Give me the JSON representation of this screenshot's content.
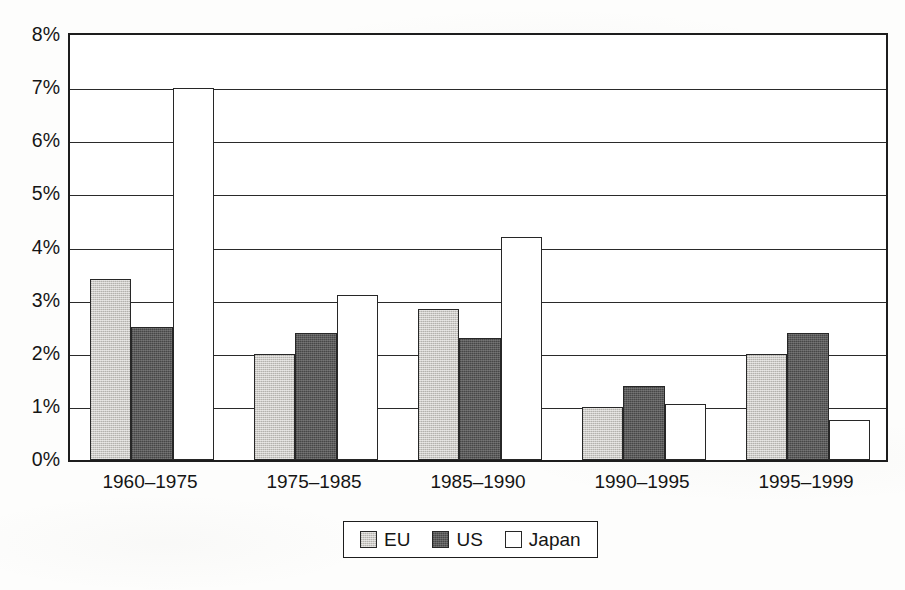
{
  "chart_data": {
    "type": "bar",
    "title": "",
    "subtitle": "",
    "xlabel": "",
    "ylabel": "",
    "ylim": [
      0,
      8
    ],
    "ytick_labels": [
      "0%",
      "1%",
      "2%",
      "3%",
      "4%",
      "5%",
      "6%",
      "7%",
      "8%"
    ],
    "ytick_values": [
      0,
      1,
      2,
      3,
      4,
      5,
      6,
      7,
      8
    ],
    "y_unit": "%",
    "grid": true,
    "grid_axis": "y",
    "legend_position": "bottom-center",
    "categories": [
      "1960–1975",
      "1975–1985",
      "1985–1990",
      "1990–1995",
      "1995–1999"
    ],
    "series": [
      {
        "name": "EU",
        "color": "#cccac6",
        "values": [
          3.4,
          2.0,
          2.85,
          1.0,
          2.0
        ]
      },
      {
        "name": "US",
        "color": "#5b5b5b",
        "values": [
          2.5,
          2.4,
          2.3,
          1.4,
          2.4
        ]
      },
      {
        "name": "Japan",
        "color": "#ffffff",
        "values": [
          7.0,
          3.1,
          4.2,
          1.05,
          0.75
        ]
      }
    ]
  },
  "legend": {
    "entries": [
      {
        "label": "EU"
      },
      {
        "label": "US"
      },
      {
        "label": "Japan"
      }
    ]
  },
  "colors": {
    "eu": "#cccac6",
    "us": "#5b5b5b",
    "japan": "#ffffff",
    "axis": "#1d1d1d",
    "gridline": "#2a2a2a",
    "text": "#151515",
    "background": "#fdfdfc"
  }
}
